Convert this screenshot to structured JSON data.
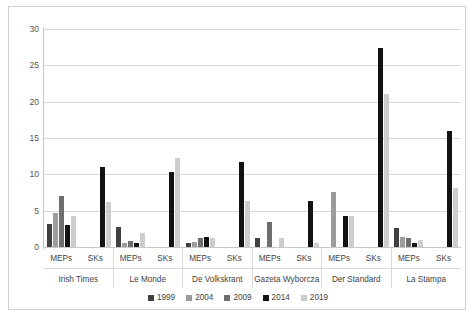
{
  "chart_data": {
    "type": "bar",
    "title": "",
    "subtitle": "",
    "xlabel": "",
    "ylabel": "",
    "ylim": [
      0,
      30
    ],
    "ytick_labels": [
      "0",
      "5",
      "10",
      "15",
      "20",
      "25",
      "30"
    ],
    "ytick_values": [
      0,
      5,
      10,
      15,
      20,
      25,
      30
    ],
    "grid": true,
    "legend_position": "bottom",
    "legend": [
      "1999",
      "2004",
      "2009",
      "2014",
      "2019"
    ],
    "series_colors": [
      "#404040",
      "#9c9c9c",
      "#6e6e6e",
      "#121212",
      "#cdcdcd"
    ],
    "group_labels": [
      "Irish Times",
      "Le Monde",
      "De Volkskrant",
      "Gazeta Wyborcza",
      "Der Standard",
      "La Stampa"
    ],
    "subgroup_labels": [
      "MEPs",
      "SKs"
    ],
    "categories": [
      "Irish Times MEPs",
      "Irish Times SKs",
      "Le Monde MEPs",
      "Le Monde SKs",
      "De Volkskrant MEPs",
      "De Volkskrant SKs",
      "Gazeta Wyborcza MEPs",
      "Gazeta Wyborcza SKs",
      "Der Standard MEPs",
      "Der Standard SKs",
      "La Stampa MEPs",
      "La Stampa SKs"
    ],
    "series": [
      {
        "name": "1999",
        "values": [
          3.1,
          0,
          2.7,
          0,
          0.5,
          0,
          1.2,
          0,
          0,
          0,
          2.6,
          0
        ]
      },
      {
        "name": "2004",
        "values": [
          4.7,
          0,
          0.5,
          0,
          0.7,
          0,
          0,
          0,
          7.6,
          0,
          1.4,
          0
        ]
      },
      {
        "name": "2009",
        "values": [
          7.0,
          0,
          0.8,
          0,
          1.3,
          0,
          3.4,
          0,
          0,
          0,
          1.2,
          0
        ]
      },
      {
        "name": "2014",
        "values": [
          3.0,
          11.0,
          0.6,
          10.3,
          1.4,
          11.7,
          0,
          6.4,
          4.3,
          27.4,
          0.5,
          16.0
        ]
      },
      {
        "name": "2019",
        "values": [
          4.2,
          6.2,
          1.9,
          12.3,
          1.2,
          6.3,
          1.2,
          0.6,
          4.3,
          21.0,
          0.9,
          8.1
        ]
      }
    ]
  }
}
